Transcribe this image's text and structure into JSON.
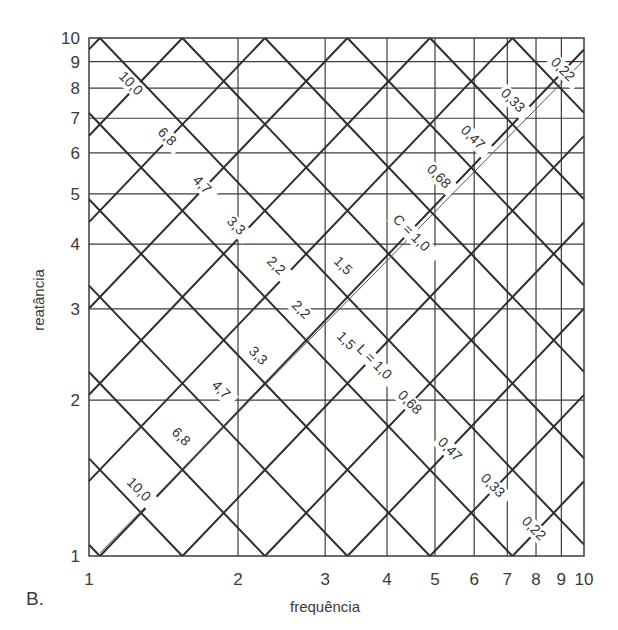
{
  "panel_label": "B.",
  "chart_data": {
    "type": "line",
    "title": "",
    "xlabel": "frequência",
    "ylabel": "reatância",
    "x_scale": "log",
    "y_scale": "log",
    "xlim": [
      1,
      10
    ],
    "ylim": [
      1,
      10
    ],
    "grid": true,
    "x_ticks": [
      "1",
      "2",
      "3",
      "4",
      "5",
      "6",
      "7",
      "8",
      "9",
      "10"
    ],
    "y_ticks": [
      "1",
      "2",
      "3",
      "4",
      "5",
      "6",
      "7",
      "8",
      "9",
      "10"
    ],
    "series_families": [
      {
        "name": "capacitância (C)",
        "direction": "falling",
        "relation": "X = 1/(2πfC)",
        "labels": [
          "10,0",
          "6,8",
          "4,7",
          "3,3",
          "C = 1,0",
          "0,68",
          "0,47",
          "0,33",
          "0,22"
        ],
        "values": [
          10.0,
          6.8,
          4.7,
          3.3,
          1.0,
          0.68,
          0.47,
          0.33,
          0.22
        ]
      },
      {
        "name": "indutância (L)",
        "direction": "rising",
        "relation": "X = 2πfL",
        "labels": [
          "10,0",
          "6,8",
          "4,7",
          "3,3",
          "2,2",
          "1,5",
          "L = 1,0",
          "0,68",
          "0,47",
          "0,33",
          "0,22"
        ],
        "values": [
          10.0,
          6.8,
          4.7,
          3.3,
          2.2,
          1.5,
          1.0,
          0.68,
          0.47,
          0.33,
          0.22
        ]
      }
    ],
    "extra_labels": [
      "2,2",
      "1,5"
    ],
    "legend": "none"
  },
  "layout": {
    "plot": {
      "x0": 89,
      "x1": 584,
      "y0": 38,
      "y1": 556
    },
    "line_color": "#2e2e2e",
    "grid_color": "#3c3c3c",
    "step_decades": 0.1667,
    "apex_offset": 0.022
  },
  "upper_labels": [
    {
      "text": "10,0",
      "x": 118,
      "y": 77
    },
    {
      "text": "6,8",
      "x": 157,
      "y": 133
    },
    {
      "text": "4,7",
      "x": 192,
      "y": 181
    },
    {
      "text": "3,3",
      "x": 226,
      "y": 222
    },
    {
      "text": "2,2",
      "x": 266,
      "y": 262
    },
    {
      "text": "1,5",
      "x": 333,
      "y": 262
    },
    {
      "text": "C = 1,0",
      "x": 392,
      "y": 220
    },
    {
      "text": "0,68",
      "x": 426,
      "y": 170
    },
    {
      "text": "0,47",
      "x": 460,
      "y": 131
    },
    {
      "text": "0,33",
      "x": 500,
      "y": 94
    },
    {
      "text": "0,22",
      "x": 550,
      "y": 63
    }
  ],
  "lower_labels": [
    {
      "text": "10,0",
      "x": 126,
      "y": 483
    },
    {
      "text": "6,8",
      "x": 171,
      "y": 433
    },
    {
      "text": "4,7",
      "x": 211,
      "y": 386
    },
    {
      "text": "3,3",
      "x": 248,
      "y": 352
    },
    {
      "text": "2,2",
      "x": 291,
      "y": 306
    },
    {
      "text": "1,5",
      "x": 336,
      "y": 337
    },
    {
      "text": "L = 1,0",
      "x": 356,
      "y": 350
    },
    {
      "text": "0,68",
      "x": 397,
      "y": 396
    },
    {
      "text": "0,47",
      "x": 437,
      "y": 443
    },
    {
      "text": "0,33",
      "x": 480,
      "y": 479
    },
    {
      "text": "0,22",
      "x": 521,
      "y": 522
    }
  ]
}
